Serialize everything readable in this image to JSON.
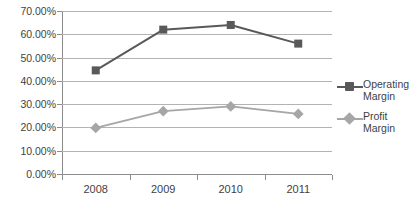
{
  "chart_data": {
    "type": "line",
    "title": "",
    "subtitle": "",
    "xlabel": "",
    "ylabel": "",
    "categories": [
      "2008",
      "2009",
      "2010",
      "2011"
    ],
    "x": [
      2008,
      2009,
      2010,
      2011
    ],
    "ylim": [
      0,
      70
    ],
    "ytick_labels": [
      "70.00%",
      "60.00%",
      "50.00%",
      "40.00%",
      "30.00%",
      "20.00%",
      "10.00%",
      "0.00%"
    ],
    "ytick_values": [
      70,
      60,
      50,
      40,
      30,
      20,
      10,
      0
    ],
    "ytick_suffix": "%",
    "grid": "horizontal",
    "legend_position": "right",
    "series": [
      {
        "name": "Operating Margin",
        "label_line1": "Operating",
        "label_line2": "Margin",
        "marker": "square",
        "color": "#595959",
        "values": [
          44.5,
          62.0,
          64.0,
          56.0
        ],
        "value_labels": [
          "44.50%",
          "62.00%",
          "64.00%",
          "56.00%"
        ]
      },
      {
        "name": "Profit Margin",
        "label_line1": "Profit",
        "label_line2": "Margin",
        "marker": "diamond",
        "color": "#a6a6a6",
        "values": [
          19.8,
          27.0,
          29.0,
          25.8
        ],
        "value_labels": [
          "19.80%",
          "27.00%",
          "29.00%",
          "25.80%"
        ]
      }
    ]
  },
  "axes": {
    "axis_line_color": "#8c8c8c",
    "gridline_color": "#b3b3b3"
  },
  "caption": {
    "text": ""
  }
}
